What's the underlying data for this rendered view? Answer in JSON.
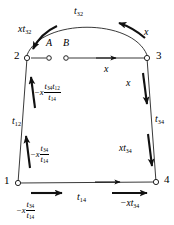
{
  "diagram": {
    "type": "signal-flow-graph",
    "nodes": [
      {
        "id": "n1",
        "label": "1",
        "x": 18,
        "y": 183
      },
      {
        "id": "n2",
        "label": "2",
        "x": 27,
        "y": 58
      },
      {
        "id": "n3",
        "label": "3",
        "x": 147,
        "y": 58
      },
      {
        "id": "n4",
        "label": "4",
        "x": 156,
        "y": 182
      },
      {
        "id": "nA",
        "label": "A",
        "x": 49,
        "y": 58
      },
      {
        "id": "nB",
        "label": "B",
        "x": 66,
        "y": 58
      }
    ],
    "edges": [
      {
        "id": "e32",
        "from": "3",
        "to": "2",
        "shape": "arc",
        "label": "t32"
      },
      {
        "id": "e23",
        "from": "2",
        "to": "3",
        "shape": "line",
        "label": "x"
      },
      {
        "id": "e12",
        "from": "1",
        "to": "2",
        "shape": "line",
        "label": "t12"
      },
      {
        "id": "e34",
        "from": "3",
        "to": "4",
        "shape": "line",
        "label": "t34"
      },
      {
        "id": "e14",
        "from": "1",
        "to": "4",
        "shape": "line",
        "label": "t14"
      }
    ],
    "labels": {
      "arc_top": {
        "base": "t",
        "sub": "32"
      },
      "arc_left_flow": {
        "coef": "x",
        "base": "t",
        "sub": "32"
      },
      "arc_right_flow": {
        "text": "x"
      },
      "top_edge_flow": {
        "text": "x"
      },
      "left_edge_name": {
        "base": "t",
        "sub": "12"
      },
      "left_upper_flow": {
        "sign": "−x",
        "numerator": [
          {
            "base": "t",
            "sub": "34"
          },
          {
            "base": "t",
            "sub": "12"
          }
        ],
        "denominator": [
          {
            "base": "t",
            "sub": "14"
          }
        ]
      },
      "left_lower_flow": {
        "sign": "−x",
        "numerator": [
          {
            "base": "t",
            "sub": "34"
          }
        ],
        "denominator": [
          {
            "base": "t",
            "sub": "14"
          }
        ]
      },
      "right_upper_flow": {
        "text": "x"
      },
      "right_edge_name": {
        "base": "t",
        "sub": "34"
      },
      "right_lower_flow": {
        "coef": "x",
        "base": "t",
        "sub": "34"
      },
      "bottom_edge_name": {
        "base": "t",
        "sub": "14"
      },
      "bottom_left_flow": {
        "sign": "−x",
        "numerator": [
          {
            "base": "t",
            "sub": "34"
          }
        ],
        "denominator": [
          {
            "base": "t",
            "sub": "14"
          }
        ]
      },
      "bottom_right_flow": {
        "sign": "−x",
        "base": "t",
        "sub": "34"
      }
    },
    "colors": {
      "stroke": "#1a1a1a",
      "text": "#000000",
      "background": "#ffffff"
    }
  }
}
